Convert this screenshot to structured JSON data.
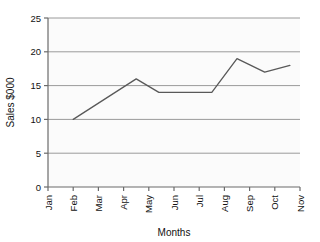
{
  "chart_data": {
    "type": "line",
    "title": "",
    "xlabel": "Months",
    "ylabel": "Sales $000",
    "categories": [
      "Jan",
      "Feb",
      "Mar",
      "Apr",
      "May",
      "Jun",
      "Jul",
      "Aug",
      "Sep",
      "Oct",
      "Nov"
    ],
    "x_tick_labels": [
      "Jan",
      "Feb",
      "Mar",
      "Apr",
      "May",
      "Jun",
      "Jul",
      "Aug",
      "Sep",
      "Oct",
      "Nov"
    ],
    "y_tick_labels": [
      "0",
      "5",
      "10",
      "15",
      "20",
      "25"
    ],
    "y_ticks": [
      0,
      5,
      10,
      15,
      20,
      25
    ],
    "ylim": [
      0,
      25
    ],
    "xlim_index": [
      0,
      10
    ],
    "grid": "horizontal",
    "legend": "none",
    "series": [
      {
        "name": "Sales",
        "color": "#595959",
        "points": [
          {
            "x": "Feb",
            "x_index": 1,
            "y": 10
          },
          {
            "x": "Apr-May",
            "x_index": 3.5,
            "y": 16
          },
          {
            "x": "May",
            "x_index": 4.4,
            "y": 14
          },
          {
            "x": "Jul",
            "x_index": 6.5,
            "y": 14
          },
          {
            "x": "Aug",
            "x_index": 7.5,
            "y": 19
          },
          {
            "x": "Sep",
            "x_index": 8.6,
            "y": 17
          },
          {
            "x": "Oct",
            "x_index": 9.6,
            "y": 18
          }
        ],
        "values": [
          null,
          10,
          13,
          15,
          14,
          14,
          14,
          19,
          17,
          18,
          null
        ]
      }
    ]
  },
  "colors": {
    "plot_background": "#fbfbfb",
    "gridline": "#9a9a9a",
    "axis": "#6b6b6b",
    "line": "#595959",
    "text": "#111111"
  },
  "axes": {
    "y_axis_title": "Sales $000",
    "x_axis_title": "Months"
  }
}
